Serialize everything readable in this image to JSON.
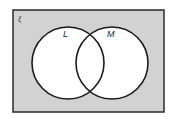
{
  "diagram": {
    "type": "venn",
    "universal_set": {
      "label": "ξ",
      "fill": "#d2d2d2",
      "stroke": "#2a2a2a",
      "x": 13,
      "y": 10,
      "width": 151,
      "height": 102
    },
    "sets": [
      {
        "label": "L",
        "cx": 68,
        "cy": 63,
        "r": 36,
        "fill": "#ffffff",
        "stroke": "#1a1a1a",
        "label_x": 63,
        "label_y": 37
      },
      {
        "label": "M",
        "cx": 112,
        "cy": 63,
        "r": 36,
        "fill": "#ffffff",
        "stroke": "#1a1a1a",
        "label_x": 107,
        "label_y": 37
      }
    ],
    "shaded_region": "complement of L ∪ M"
  }
}
